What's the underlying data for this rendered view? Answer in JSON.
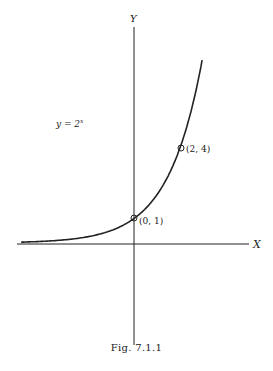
{
  "chart_data": {
    "type": "line",
    "title": "",
    "xlabel": "X",
    "ylabel": "Y",
    "series": [
      {
        "name": "y = 2^x",
        "function": "2^x",
        "x": [
          -4.7,
          -4,
          -3,
          -2,
          -1,
          0,
          1,
          2,
          2.9
        ],
        "values": [
          0.04,
          0.0625,
          0.125,
          0.25,
          0.5,
          1,
          2,
          4,
          7.5
        ]
      }
    ],
    "annotations": [
      {
        "label": "(0, 1)",
        "x": 0,
        "y": 1
      },
      {
        "label": "(2, 4)",
        "x": 2,
        "y": 4
      },
      {
        "label": "y = 2^x"
      }
    ],
    "grid": false,
    "caption": "Fig. 7.1.1"
  },
  "labels": {
    "x_axis": "X",
    "y_axis": "Y",
    "equation_base": "y = 2",
    "equation_exp": "x",
    "point_a": "(0, 1)",
    "point_b": "(2, 4)",
    "caption": "Fig. 7.1.1"
  }
}
